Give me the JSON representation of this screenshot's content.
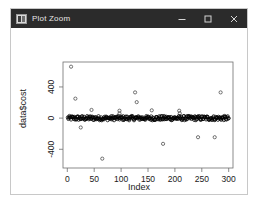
{
  "window": {
    "title": "Plot Zoom",
    "icon": "plot-window-icon",
    "controls": {
      "minimize": "–",
      "maximize": "□",
      "close": "×"
    }
  },
  "chart_data": {
    "type": "scatter",
    "title": "",
    "xlabel": "Index",
    "ylabel": "data$cost",
    "xlim": [
      -8,
      308
    ],
    "ylim": [
      -640,
      720
    ],
    "xticks": [
      0,
      50,
      100,
      150,
      200,
      250,
      300
    ],
    "xticklabels": [
      "0",
      "50",
      "100",
      "150",
      "200",
      "250",
      "300"
    ],
    "yticks": [
      -400,
      0,
      400
    ],
    "yticklabels": [
      "-400",
      "0",
      "400"
    ],
    "grid": false,
    "legend": null,
    "marker": "open-circle",
    "series": [
      {
        "name": "data$cost",
        "comment": "dense baseline band near zero plus sparse outliers",
        "outliers": [
          {
            "x": 7,
            "y": 660
          },
          {
            "x": 15,
            "y": 250
          },
          {
            "x": 25,
            "y": -120
          },
          {
            "x": 45,
            "y": 105
          },
          {
            "x": 65,
            "y": -520
          },
          {
            "x": 97,
            "y": 95
          },
          {
            "x": 97,
            "y": 60
          },
          {
            "x": 126,
            "y": 330
          },
          {
            "x": 129,
            "y": 205
          },
          {
            "x": 157,
            "y": 100
          },
          {
            "x": 178,
            "y": -330
          },
          {
            "x": 208,
            "y": 95
          },
          {
            "x": 209,
            "y": 62
          },
          {
            "x": 243,
            "y": -245
          },
          {
            "x": 274,
            "y": -245
          },
          {
            "x": 285,
            "y": 330
          }
        ],
        "baseline_band": {
          "y_center": 0,
          "y_spread": 28,
          "x_from": 1,
          "x_to": 300,
          "count": 300
        }
      }
    ]
  }
}
